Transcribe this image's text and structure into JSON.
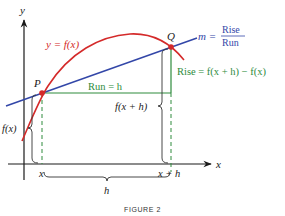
{
  "figure": {
    "caption": "FIGURE 2",
    "colors": {
      "axis": "#1a1a1a",
      "curve": "#d42a2a",
      "secant": "#3347a8",
      "run_rise": "#2e8b3c",
      "brace": "#333333",
      "label_blue": "#3347a8",
      "label_red": "#d42a2a",
      "label_green": "#2e8b3c"
    },
    "axes": {
      "x_label": "x",
      "y_label": "y"
    },
    "points": {
      "P": {
        "label": "P",
        "x": 42,
        "y": 93
      },
      "Q": {
        "label": "Q",
        "x": 171,
        "y": 47
      }
    },
    "labels": {
      "curve": "y = f(x)",
      "slope_m": "m =",
      "slope_num": "Rise",
      "slope_den": "Run",
      "run": "Run = h",
      "rise": "Rise = f(x + h) − f(x)",
      "fx": "f(x)",
      "fxh": "f(x + h)",
      "tick_x": "x",
      "tick_xh": "x + h",
      "h": "h"
    }
  }
}
